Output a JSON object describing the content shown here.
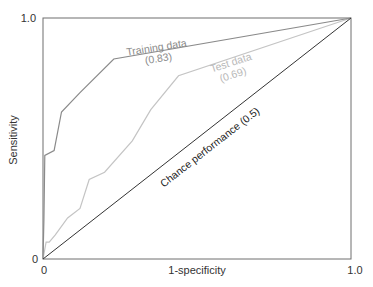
{
  "chart_data": {
    "type": "line",
    "title": "",
    "xlabel": "1-specificity",
    "ylabel": "Sensitivity",
    "xlim": [
      0,
      1.0
    ],
    "ylim": [
      0,
      1.0
    ],
    "x_ticks": [
      "0",
      "1.0"
    ],
    "y_ticks": [
      "0",
      "1.0"
    ],
    "grid": false,
    "legend": "inline annotations",
    "series": [
      {
        "name": "Training data",
        "auc_label": "(0.83)",
        "color": "#8a8a8a",
        "x": [
          0,
          0.003,
          0.006,
          0.036,
          0.06,
          0.12,
          0.23,
          1.0
        ],
        "y": [
          0,
          0.16,
          0.43,
          0.45,
          0.61,
          0.69,
          0.83,
          1.0
        ]
      },
      {
        "name": "Test data",
        "auc_label": "(0.69)",
        "color": "#c4c4c4",
        "x": [
          0,
          0.01,
          0.02,
          0.04,
          0.08,
          0.12,
          0.15,
          0.2,
          0.29,
          0.35,
          0.44,
          1.0
        ],
        "y": [
          0,
          0.07,
          0.07,
          0.1,
          0.17,
          0.21,
          0.33,
          0.36,
          0.49,
          0.62,
          0.76,
          1.0
        ]
      },
      {
        "name": "Chance performance",
        "auc_label": "(0.5)",
        "color": "#333333",
        "x": [
          0,
          1.0
        ],
        "y": [
          0,
          1.0
        ]
      }
    ],
    "annotations": [
      {
        "text": "Training data",
        "series": 0
      },
      {
        "text": "(0.83)",
        "series": 0
      },
      {
        "text": "Test data",
        "series": 1
      },
      {
        "text": "(0.69)",
        "series": 1
      },
      {
        "text": "Chance performance (0.5)",
        "series": 2
      }
    ]
  },
  "labels": {
    "xlabel": "1-specificity",
    "ylabel": "Sensitivity",
    "x_tick_min": "0",
    "x_tick_max": "1.0",
    "y_tick_min": "0",
    "y_tick_max": "1.0",
    "training_name": "Training data",
    "training_auc": "(0.83)",
    "test_name": "Test data",
    "test_auc": "(0.69)",
    "chance": "Chance performance (0.5)"
  }
}
